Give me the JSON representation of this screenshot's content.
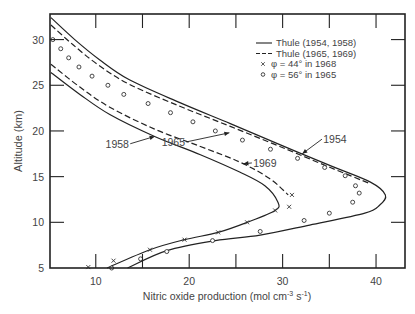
{
  "chart_data": {
    "type": "line",
    "title": "",
    "xlabel": "Nitric oxide production (mol cm⁻³ s⁻¹)",
    "xlabel_parts": {
      "main": "Nitric oxide production (mol cm",
      "exp1": "-3",
      "mid": " s",
      "exp2": "-1",
      "end": ")"
    },
    "ylabel": "Altitude (km)",
    "xlim": [
      5.1,
      43.1
    ],
    "ylim": [
      5,
      32.8
    ],
    "x_ticks": [
      10,
      20,
      30,
      40
    ],
    "x_minor_ticks": [
      15,
      25,
      35
    ],
    "y_ticks": [
      5,
      10,
      15,
      20,
      25,
      30
    ],
    "grid": false,
    "legend_position": "upper right",
    "legend": [
      {
        "label": "Thule (1954, 1958)",
        "style": "solid"
      },
      {
        "label": "Thule (1965, 1969)",
        "style": "dashed"
      },
      {
        "label": "φ = 44°  in 1968",
        "style": "cross"
      },
      {
        "label": "φ = 56°  in 1965",
        "style": "circle"
      }
    ],
    "series": [
      {
        "name": "Thule 1954",
        "style": "solid",
        "points": [
          [
            5.2,
            32.4
          ],
          [
            7.75,
            30
          ],
          [
            10.4,
            27.8
          ],
          [
            13.6,
            25.6
          ],
          [
            19,
            23.1
          ],
          [
            24.4,
            20.8
          ],
          [
            29.7,
            18.5
          ],
          [
            35.1,
            16.2
          ],
          [
            39.4,
            14.4
          ],
          [
            41,
            13
          ],
          [
            40.4,
            11.9
          ],
          [
            38.8,
            11
          ],
          [
            32.9,
            9.7
          ],
          [
            27.6,
            8.6
          ],
          [
            22.8,
            8
          ],
          [
            17.6,
            6.9
          ],
          [
            13.4,
            5
          ]
        ]
      },
      {
        "name": "Thule 1965",
        "style": "dashed",
        "points": [
          [
            5.2,
            31.6
          ],
          [
            7.6,
            29.4
          ],
          [
            10.3,
            27.2
          ],
          [
            13.6,
            25.1
          ],
          [
            19,
            22.7
          ],
          [
            24.4,
            20.5
          ],
          [
            29.7,
            18.3
          ],
          [
            35.1,
            16
          ],
          [
            39.2,
            14.3
          ]
        ]
      },
      {
        "name": "Thule 1958",
        "style": "solid",
        "points": [
          [
            5.2,
            26.4
          ],
          [
            8.3,
            24
          ],
          [
            11.5,
            21.8
          ],
          [
            16.3,
            19.4
          ],
          [
            21.2,
            17.4
          ],
          [
            25.4,
            15.5
          ],
          [
            28.1,
            14
          ],
          [
            29.5,
            12.2
          ],
          [
            29.2,
            11.3
          ],
          [
            26.2,
            10
          ],
          [
            23.1,
            8.9
          ],
          [
            19.5,
            8.1
          ],
          [
            15.8,
            7
          ],
          [
            11.2,
            5
          ]
        ]
      },
      {
        "name": "Thule 1969",
        "style": "dashed",
        "points": [
          [
            5.2,
            27.3
          ],
          [
            8.3,
            24.8
          ],
          [
            11.5,
            22.6
          ],
          [
            16.3,
            20.2
          ],
          [
            21.2,
            18.3
          ],
          [
            25.4,
            16.6
          ],
          [
            28.6,
            14.8
          ],
          [
            30.6,
            13.0
          ]
        ]
      },
      {
        "name": "φ = 44° in 1968",
        "style": "cross",
        "points": [
          [
            9.2,
            5.1
          ],
          [
            11.9,
            5.8
          ],
          [
            15.8,
            7
          ],
          [
            19.5,
            8.1
          ],
          [
            23.1,
            8.9
          ],
          [
            26.2,
            10
          ],
          [
            29.2,
            11.3
          ],
          [
            30.7,
            11.7
          ],
          [
            31,
            13.0
          ]
        ]
      },
      {
        "name": "φ = 56° in 1965",
        "style": "circle",
        "points": [
          [
            5.4,
            30
          ],
          [
            6.25,
            29
          ],
          [
            7.1,
            28
          ],
          [
            8.2,
            27
          ],
          [
            9.6,
            26
          ],
          [
            11.3,
            25
          ],
          [
            13,
            24
          ],
          [
            15.6,
            23
          ],
          [
            18,
            22
          ],
          [
            20.4,
            21
          ],
          [
            22.8,
            20
          ],
          [
            25.7,
            19
          ],
          [
            28.7,
            18
          ],
          [
            31.6,
            17
          ],
          [
            34.5,
            16
          ],
          [
            36.7,
            15.1
          ],
          [
            37.8,
            14
          ],
          [
            38.2,
            13.2
          ],
          [
            37.5,
            12.2
          ],
          [
            35,
            11
          ],
          [
            32.3,
            10.2
          ],
          [
            27.6,
            9
          ],
          [
            22.5,
            8
          ],
          [
            17.6,
            6.8
          ],
          [
            14.8,
            6
          ],
          [
            11.7,
            5
          ]
        ]
      }
    ],
    "annotations": [
      {
        "text": "1954",
        "x": 35.6,
        "y": 19.1,
        "arrow_to": [
          32.1,
          17.5
        ]
      },
      {
        "text": "1965",
        "x": 18.3,
        "y": 18.8,
        "arrow_to": [
          24.3,
          19.8
        ]
      },
      {
        "text": "1969",
        "x": 28.1,
        "y": 16.5,
        "arrow_to": [
          25.8,
          16.4
        ]
      },
      {
        "text": "1958",
        "x": 12.3,
        "y": 18.6,
        "arrow_to": [
          16.3,
          19.4
        ]
      }
    ]
  }
}
